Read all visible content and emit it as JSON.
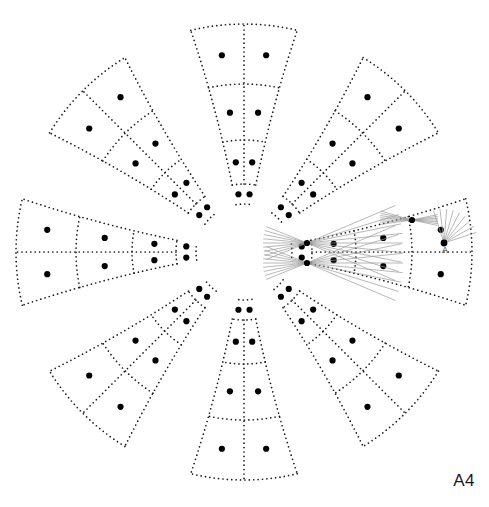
{
  "figure": {
    "title": "A4",
    "corner_label": "A4",
    "background_color": "#ffffff",
    "stroke_color": "#1a1a1a",
    "ray_color": "#9a9a9a",
    "dot_color": "#000000",
    "canvas": {
      "width": 489,
      "height": 507
    },
    "center": {
      "x": 244,
      "y": 252
    },
    "geometry": {
      "type": "radial-petal-array",
      "petal_count": 8,
      "sector_angle_deg": 45,
      "cells_per_petal": 6,
      "cell_rows": 2,
      "cell_columns": 3,
      "inner_radius": 48,
      "outer_radius": 228,
      "ring_boundary_radii": [
        48,
        68,
        112,
        168,
        228
      ],
      "angular_half_width_deg": 13.5,
      "inner_angular_half_width_deg": 9.5,
      "dot_marker_radius": 3.1,
      "dash_dot_radius": 0.85,
      "dash_spacing": 4.4
    },
    "petals": [
      {
        "name": "petal-n",
        "angle_deg": -90,
        "label": "North"
      },
      {
        "name": "petal-ne",
        "angle_deg": -45,
        "label": "North-East"
      },
      {
        "name": "petal-e",
        "angle_deg": 0,
        "label": "East"
      },
      {
        "name": "petal-se",
        "angle_deg": 45,
        "label": "South-East"
      },
      {
        "name": "petal-s",
        "angle_deg": 90,
        "label": "South"
      },
      {
        "name": "petal-sw",
        "angle_deg": 135,
        "label": "South-West"
      },
      {
        "name": "petal-w",
        "angle_deg": 180,
        "label": "West"
      },
      {
        "name": "petal-nw",
        "angle_deg": -135,
        "label": "North-West"
      }
    ],
    "inner_dot_pairs": {
      "radius": 58,
      "offset_deg": 5.5,
      "count_per_petal": 2
    },
    "annotation": {
      "label": "A",
      "label_x": 445,
      "label_y": 253,
      "apex_x": 444,
      "apex_y": 243,
      "fan_count": 9,
      "fan_length": 34,
      "fan_start_deg": -108,
      "fan_end_deg": -18
    },
    "ray_bundles": [
      {
        "name": "ray-bundle-upper",
        "origin_x": 307,
        "origin_y": 243,
        "spread_left_deg": [
          158,
          202
        ],
        "spread_right_deg": [
          -23,
          23
        ],
        "count": 9,
        "left_length": 44,
        "right_length": 96
      },
      {
        "name": "ray-bundle-lower",
        "origin_x": 307,
        "origin_y": 263,
        "spread_left_deg": [
          158,
          202
        ],
        "spread_right_deg": [
          -23,
          23
        ],
        "count": 9,
        "left_length": 44,
        "right_length": 96
      },
      {
        "name": "ray-bundle-edge",
        "origin_x": 412,
        "origin_y": 220,
        "spread_left_deg": [
          172,
          196
        ],
        "spread_right_deg": [
          -12,
          12
        ],
        "count": 7,
        "left_length": 32,
        "right_length": 26
      }
    ]
  }
}
